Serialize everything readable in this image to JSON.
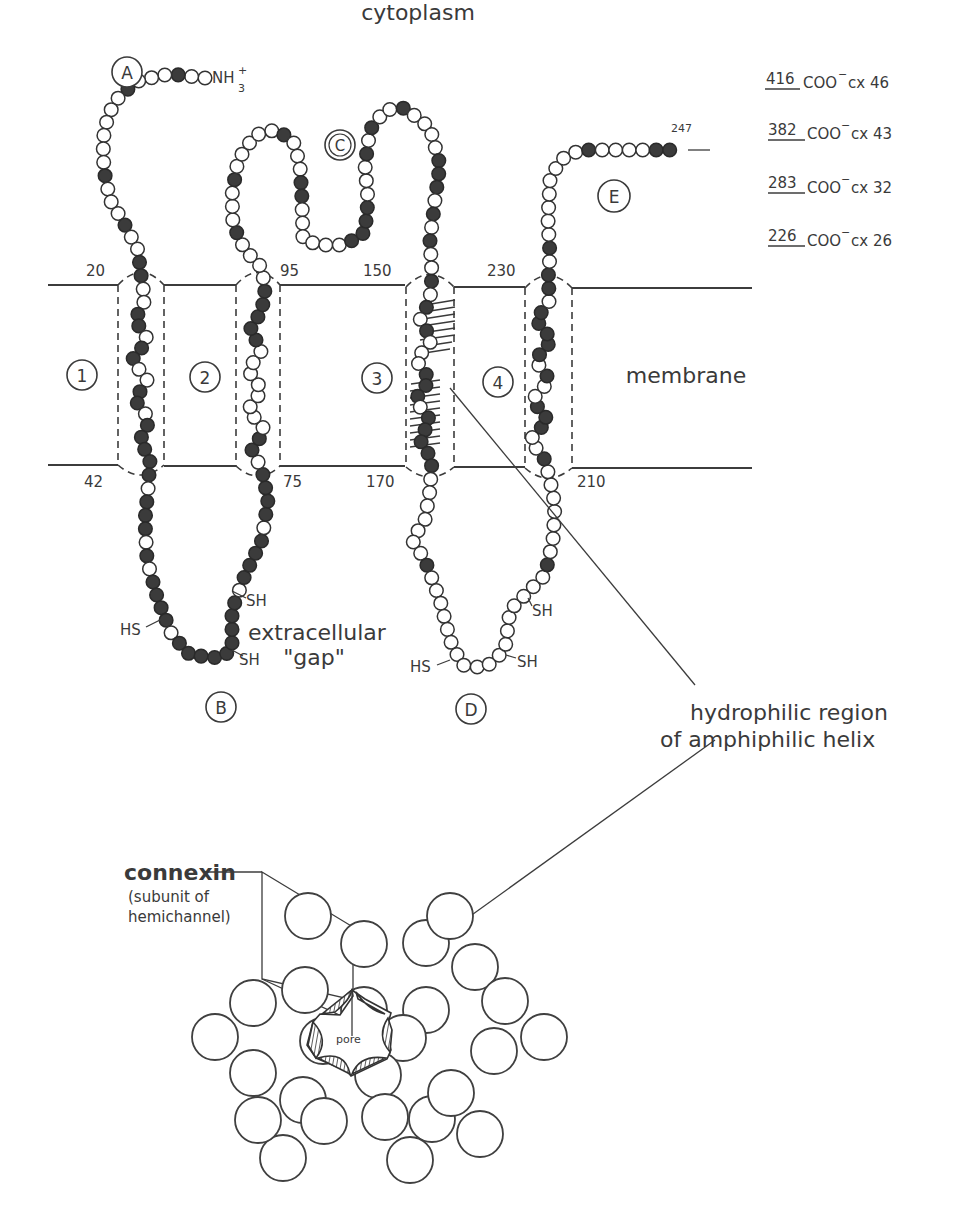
{
  "figure": {
    "compartments": {
      "cytoplasm": "cytoplasm",
      "membrane": "membrane",
      "extracellular_line1": "extracellular",
      "extracellular_line2": "\"gap\""
    },
    "terminus": {
      "n_terminus": "NH",
      "n_sub": "3",
      "n_sup": "+",
      "c_end_residue": "247"
    },
    "domains": [
      {
        "id": "A",
        "label": "A"
      },
      {
        "id": "B",
        "label": "B"
      },
      {
        "id": "C",
        "label": "C"
      },
      {
        "id": "D",
        "label": "D"
      },
      {
        "id": "E",
        "label": "E"
      }
    ],
    "transmembrane_segments": [
      {
        "label": "1",
        "top_residue": "20",
        "bottom_residue": "42"
      },
      {
        "label": "2",
        "top_residue": "95",
        "bottom_residue": "75"
      },
      {
        "label": "3",
        "top_residue": "150",
        "bottom_residue": "170"
      },
      {
        "label": "4",
        "top_residue": "230",
        "bottom_residue": "210"
      }
    ],
    "sulfhydryl_labels": {
      "b_left": "HS",
      "b_right_upper": "SH",
      "b_right_lower": "SH",
      "d_left": "HS",
      "d_right_upper": "SH",
      "d_right_lower": "SH"
    },
    "c_terminal_variants": [
      {
        "residue": "416",
        "group": "COO",
        "charge": "−",
        "name": "cx 46"
      },
      {
        "residue": "382",
        "group": "COO",
        "charge": "−",
        "name": "cx 43"
      },
      {
        "residue": "283",
        "group": "COO",
        "charge": "−",
        "name": "cx 32"
      },
      {
        "residue": "226",
        "group": "COO",
        "charge": "−",
        "name": "cx 26"
      }
    ],
    "annotation": {
      "line1": "hydrophilic region",
      "line2": "of amphiphilic helix"
    },
    "hemichannel": {
      "connexin_label": "connexin",
      "connexin_sub1": "(subunit of",
      "connexin_sub2": "hemichannel)",
      "pore_label": "pore"
    },
    "colors": {
      "ink": "#3a3a3a",
      "filled_residue": "#3b3b3b",
      "background": "#ffffff"
    }
  }
}
